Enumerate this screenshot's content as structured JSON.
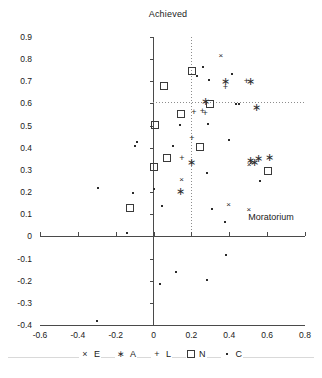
{
  "chart_data": {
    "type": "scatter",
    "title": "Achieved",
    "xlabel": "",
    "ylabel": "",
    "xlim": [
      -0.6,
      0.8
    ],
    "ylim": [
      -0.4,
      0.9
    ],
    "xticks": [
      "-0.6",
      "-0.4",
      "-0.2",
      "0",
      "0.2",
      "0.4",
      "0.6",
      "0.8"
    ],
    "xtick_values": [
      -0.6,
      -0.4,
      -0.2,
      0,
      0.2,
      0.4,
      0.6,
      0.8
    ],
    "yticks": [
      "0.9",
      "0.8",
      "0.7",
      "0.6",
      "0.5",
      "0.4",
      "0.3",
      "0.2",
      "0.1",
      "0",
      "-0.1",
      "-0.2",
      "-0.3",
      "-0.4"
    ],
    "ytick_values": [
      0.9,
      0.8,
      0.7,
      0.6,
      0.5,
      0.4,
      0.3,
      0.2,
      0.1,
      0,
      -0.1,
      -0.2,
      -0.3,
      -0.4
    ],
    "grid": false,
    "legend_position": "bottom",
    "annotations": [
      {
        "text": "Achieved",
        "x": 0.0,
        "y": 0.95,
        "role": "top-axis-label"
      },
      {
        "text": "Moratorium",
        "x": 0.58,
        "y": 0.08,
        "role": "quadrant-label"
      }
    ],
    "reference_lines": [
      {
        "orientation": "vertical",
        "value": 0.2,
        "style": "dotted"
      },
      {
        "orientation": "horizontal",
        "value": 0.29,
        "style": "dotted"
      },
      {
        "orientation": "vertical",
        "value": 0.0,
        "style": "solid"
      },
      {
        "orientation": "horizontal",
        "value": 0.0,
        "style": "solid"
      }
    ],
    "series": [
      {
        "name": "E",
        "label": "E",
        "marker": "x",
        "symbol": "×",
        "points": [
          {
            "x": 0.355,
            "y": 0.812
          },
          {
            "x": 0.148,
            "y": 0.253
          },
          {
            "x": 0.505,
            "y": 0.323
          },
          {
            "x": 0.517,
            "y": 0.33
          },
          {
            "x": 0.396,
            "y": 0.142
          },
          {
            "x": 0.503,
            "y": 0.121
          }
        ]
      },
      {
        "name": "A",
        "label": "A",
        "marker": "asterisk",
        "symbol": "✳",
        "points": [
          {
            "x": 0.38,
            "y": 0.7
          },
          {
            "x": 0.513,
            "y": 0.702
          },
          {
            "x": 0.272,
            "y": 0.613
          },
          {
            "x": 0.545,
            "y": 0.585
          },
          {
            "x": 0.143,
            "y": 0.207
          },
          {
            "x": 0.512,
            "y": 0.345
          },
          {
            "x": 0.531,
            "y": 0.337
          },
          {
            "x": 0.556,
            "y": 0.356
          },
          {
            "x": 0.612,
            "y": 0.358
          },
          {
            "x": 0.203,
            "y": 0.338
          }
        ]
      },
      {
        "name": "L",
        "label": "L",
        "marker": "plus",
        "symbol": "+",
        "points": [
          {
            "x": 0.379,
            "y": 0.675
          },
          {
            "x": 0.491,
            "y": 0.702
          },
          {
            "x": 0.258,
            "y": 0.565
          },
          {
            "x": 0.272,
            "y": 0.555
          },
          {
            "x": 0.213,
            "y": 0.563
          },
          {
            "x": 0.203,
            "y": 0.444
          },
          {
            "x": 0.15,
            "y": 0.355
          }
        ]
      },
      {
        "name": "N",
        "label": "N",
        "marker": "square",
        "symbol": "□",
        "points": [
          {
            "x": 0.203,
            "y": 0.745
          },
          {
            "x": 0.056,
            "y": 0.677
          },
          {
            "x": 0.143,
            "y": 0.553
          },
          {
            "x": 0.006,
            "y": 0.505
          },
          {
            "x": 0.3,
            "y": 0.596
          },
          {
            "x": 0.245,
            "y": 0.402
          },
          {
            "x": 0.07,
            "y": 0.355
          },
          {
            "x": 0.004,
            "y": 0.311
          },
          {
            "x": 0.607,
            "y": 0.293
          },
          {
            "x": -0.122,
            "y": 0.126
          }
        ]
      },
      {
        "name": "C",
        "label": "C",
        "marker": "dot",
        "symbol": "·",
        "points": [
          {
            "x": 0.26,
            "y": 0.765
          },
          {
            "x": 0.232,
            "y": 0.723
          },
          {
            "x": 0.293,
            "y": 0.707
          },
          {
            "x": 0.415,
            "y": 0.735
          },
          {
            "x": 0.435,
            "y": 0.597
          },
          {
            "x": 0.45,
            "y": 0.597
          },
          {
            "x": 0.141,
            "y": 0.505
          },
          {
            "x": 0.29,
            "y": 0.508
          },
          {
            "x": 0.398,
            "y": 0.436
          },
          {
            "x": 0.104,
            "y": 0.407
          },
          {
            "x": -0.085,
            "y": 0.425
          },
          {
            "x": -0.098,
            "y": 0.407
          },
          {
            "x": 0.28,
            "y": 0.288
          },
          {
            "x": 0.564,
            "y": 0.252
          },
          {
            "x": -0.292,
            "y": 0.219
          },
          {
            "x": -0.108,
            "y": 0.198
          },
          {
            "x": 0.004,
            "y": 0.216
          },
          {
            "x": 0.045,
            "y": 0.135
          },
          {
            "x": 0.307,
            "y": 0.124
          },
          {
            "x": 0.378,
            "y": 0.066
          },
          {
            "x": -0.14,
            "y": 0.016
          },
          {
            "x": 0.38,
            "y": -0.086
          },
          {
            "x": 0.118,
            "y": -0.163
          },
          {
            "x": 0.282,
            "y": -0.196
          },
          {
            "x": 0.035,
            "y": -0.213
          },
          {
            "x": -0.3,
            "y": -0.381
          }
        ]
      }
    ]
  }
}
